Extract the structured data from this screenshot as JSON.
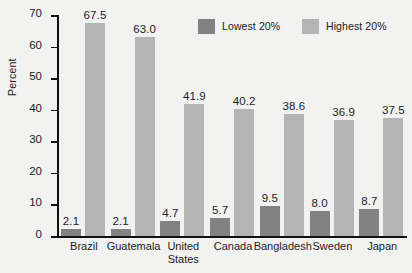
{
  "chart_data": {
    "type": "bar",
    "title": "",
    "xlabel": "",
    "ylabel": "Percent",
    "ylim": [
      0,
      70
    ],
    "yticks": [
      0,
      10,
      20,
      30,
      40,
      50,
      60,
      70
    ],
    "grid": false,
    "legend_position": "top-right",
    "categories": [
      "Brazil",
      "Guatemala",
      "United States",
      "Canada",
      "Bangladesh",
      "Sweden",
      "Japan"
    ],
    "category_lines": [
      [
        "Brazil"
      ],
      [
        "Guatemala"
      ],
      [
        "United",
        "States"
      ],
      [
        "Canada"
      ],
      [
        "Bangladesh"
      ],
      [
        "Sweden"
      ],
      [
        "Japan"
      ]
    ],
    "series": [
      {
        "name": "Lowest 20%",
        "color": "#828282",
        "values": [
          2.1,
          2.1,
          4.7,
          5.7,
          9.5,
          8.0,
          8.7
        ],
        "labels": [
          "2.1",
          "2.1",
          "4.7",
          "5.7",
          "9.5",
          "8.0",
          "8.7"
        ]
      },
      {
        "name": "Highest 20%",
        "color": "#b4b4b4",
        "values": [
          67.5,
          63.0,
          41.9,
          40.2,
          38.6,
          36.9,
          37.5
        ],
        "labels": [
          "67.5",
          "63.0",
          "41.9",
          "40.2",
          "38.6",
          "36.9",
          "37.5"
        ]
      }
    ]
  },
  "legend": {
    "items": [
      {
        "label": "Lowest 20%",
        "color": "#828282"
      },
      {
        "label": "Highest 20%",
        "color": "#b4b4b4"
      }
    ]
  },
  "axis": {
    "y_title": "Percent",
    "y_tick_labels": [
      "70",
      "60",
      "50",
      "40",
      "30",
      "20",
      "10",
      "0"
    ]
  },
  "colors": {
    "background": "#f2f2f0",
    "axis": "#111111",
    "text": "#1c1c1c",
    "lowest": "#828282",
    "highest": "#b4b4b4"
  }
}
